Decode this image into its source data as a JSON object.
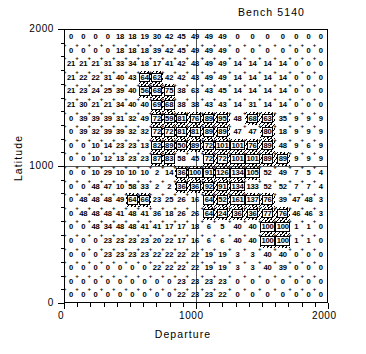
{
  "chart_data": {
    "type": "heatmap",
    "title": "Bench 5140",
    "xlabel": "Departure",
    "ylabel": "Latitude",
    "xlim": [
      0,
      2000
    ],
    "ylim": [
      0,
      2000
    ],
    "xticks": [
      "0",
      "1000",
      "2000"
    ],
    "yticks": [
      "0",
      "1000",
      "2000"
    ],
    "grid": true,
    "legend": "none",
    "nrows": 20,
    "ncols": 20,
    "cell_size": 100,
    "annotation": "Each cell is labelled with its block grade value; hatched cells mark the ore-body outline.",
    "values": [
      [
        0,
        0,
        0,
        0,
        18,
        18,
        19,
        30,
        42,
        45,
        49,
        49,
        49,
        0,
        0,
        0,
        0,
        0,
        0,
        0
      ],
      [
        0,
        0,
        0,
        0,
        18,
        18,
        18,
        39,
        42,
        45,
        49,
        49,
        49,
        0,
        0,
        0,
        0,
        0,
        0,
        0
      ],
      [
        21,
        21,
        21,
        31,
        33,
        34,
        18,
        17,
        41,
        42,
        48,
        49,
        49,
        14,
        14,
        14,
        14,
        0,
        0,
        0
      ],
      [
        21,
        22,
        22,
        31,
        40,
        43,
        64,
        62,
        42,
        42,
        43,
        49,
        49,
        14,
        14,
        14,
        14,
        0,
        0,
        0
      ],
      [
        21,
        23,
        24,
        25,
        39,
        40,
        56,
        68,
        75,
        38,
        63,
        43,
        45,
        14,
        14,
        14,
        14,
        0,
        0,
        0
      ],
      [
        21,
        30,
        21,
        21,
        34,
        40,
        40,
        69,
        68,
        38,
        38,
        43,
        43,
        14,
        31,
        14,
        14,
        0,
        0,
        0
      ],
      [
        0,
        39,
        39,
        39,
        31,
        32,
        49,
        72,
        59,
        81,
        76,
        89,
        95,
        48,
        68,
        63,
        35,
        9,
        9,
        9
      ],
      [
        0,
        39,
        32,
        39,
        39,
        32,
        32,
        72,
        72,
        81,
        81,
        89,
        89,
        47,
        47,
        80,
        18,
        9,
        9,
        9
      ],
      [
        0,
        0,
        10,
        14,
        23,
        23,
        13,
        82,
        89,
        50,
        89,
        72,
        101,
        101,
        76,
        89,
        48,
        9,
        6,
        9
      ],
      [
        0,
        0,
        10,
        12,
        13,
        23,
        23,
        87,
        83,
        58,
        45,
        72,
        72,
        101,
        101,
        89,
        89,
        9,
        9,
        9
      ],
      [
        0,
        0,
        10,
        29,
        10,
        10,
        10,
        2,
        14,
        36,
        100,
        91,
        126,
        134,
        105,
        52,
        49,
        7,
        5,
        4
      ],
      [
        0,
        0,
        48,
        47,
        10,
        58,
        33,
        2,
        2,
        36,
        36,
        92,
        91,
        134,
        133,
        52,
        52,
        7,
        7,
        4
      ],
      [
        0,
        48,
        48,
        48,
        49,
        64,
        66,
        23,
        25,
        26,
        16,
        64,
        52,
        161,
        137,
        76,
        39,
        47,
        48,
        3
      ],
      [
        0,
        48,
        48,
        48,
        41,
        48,
        41,
        36,
        18,
        26,
        26,
        64,
        24,
        36,
        36,
        77,
        76,
        46,
        46,
        3
      ],
      [
        0,
        0,
        48,
        34,
        48,
        48,
        41,
        41,
        17,
        17,
        18,
        6,
        5,
        40,
        40,
        100,
        100,
        1,
        1,
        0
      ],
      [
        0,
        0,
        0,
        23,
        23,
        23,
        23,
        20,
        22,
        17,
        16,
        6,
        6,
        40,
        40,
        100,
        100,
        1,
        1,
        0
      ],
      [
        0,
        0,
        0,
        23,
        23,
        23,
        23,
        22,
        22,
        22,
        22,
        19,
        19,
        3,
        3,
        40,
        40,
        0,
        0,
        0
      ],
      [
        0,
        0,
        0,
        0,
        0,
        0,
        0,
        22,
        22,
        22,
        22,
        19,
        19,
        3,
        3,
        40,
        39,
        0,
        0,
        0
      ],
      [
        0,
        0,
        0,
        0,
        0,
        0,
        0,
        0,
        0,
        23,
        23,
        23,
        23,
        0,
        0,
        0,
        0,
        0,
        0,
        0
      ],
      [
        0,
        0,
        0,
        0,
        0,
        0,
        0,
        0,
        0,
        22,
        23,
        23,
        22,
        0,
        0,
        0,
        0,
        0,
        0,
        0
      ]
    ],
    "shaded_cells": [
      [
        3,
        6
      ],
      [
        3,
        7
      ],
      [
        4,
        6
      ],
      [
        4,
        7
      ],
      [
        4,
        8
      ],
      [
        5,
        7
      ],
      [
        5,
        8
      ],
      [
        6,
        7
      ],
      [
        6,
        8
      ],
      [
        6,
        9
      ],
      [
        6,
        10
      ],
      [
        6,
        11
      ],
      [
        6,
        12
      ],
      [
        6,
        14
      ],
      [
        6,
        15
      ],
      [
        7,
        7
      ],
      [
        7,
        8
      ],
      [
        7,
        9
      ],
      [
        7,
        10
      ],
      [
        7,
        11
      ],
      [
        7,
        12
      ],
      [
        7,
        15
      ],
      [
        8,
        7
      ],
      [
        8,
        8
      ],
      [
        8,
        9
      ],
      [
        8,
        10
      ],
      [
        8,
        11
      ],
      [
        8,
        12
      ],
      [
        8,
        13
      ],
      [
        8,
        14
      ],
      [
        8,
        15
      ],
      [
        9,
        7
      ],
      [
        9,
        8
      ],
      [
        9,
        11
      ],
      [
        9,
        12
      ],
      [
        9,
        13
      ],
      [
        9,
        14
      ],
      [
        9,
        15
      ],
      [
        9,
        16
      ],
      [
        10,
        9
      ],
      [
        10,
        10
      ],
      [
        10,
        11
      ],
      [
        10,
        12
      ],
      [
        10,
        13
      ],
      [
        10,
        14
      ],
      [
        11,
        9
      ],
      [
        11,
        10
      ],
      [
        11,
        11
      ],
      [
        11,
        12
      ],
      [
        11,
        13
      ],
      [
        12,
        5
      ],
      [
        12,
        6
      ],
      [
        12,
        11
      ],
      [
        12,
        12
      ],
      [
        12,
        13
      ],
      [
        12,
        14
      ],
      [
        12,
        15
      ],
      [
        13,
        11
      ],
      [
        13,
        12
      ],
      [
        13,
        13
      ],
      [
        13,
        14
      ],
      [
        13,
        15
      ],
      [
        13,
        16
      ],
      [
        14,
        15
      ],
      [
        14,
        16
      ],
      [
        15,
        15
      ],
      [
        15,
        16
      ]
    ]
  }
}
